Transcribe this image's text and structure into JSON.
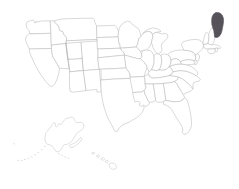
{
  "map": {
    "title": "United States Map",
    "type": "choropleth",
    "projection": "albers-usa",
    "background_color": "#ffffff",
    "default_fill": "#ffffff",
    "outline_color": "#b9b9bd",
    "highlight_color": "#55525a",
    "highlighted_regions": [
      "Maine"
    ],
    "includes_insets": [
      "Alaska",
      "Hawaii"
    ],
    "region_count": 51,
    "legend": null,
    "labels_visible": false
  },
  "regions": [
    {
      "id": "WA",
      "name": "Washington",
      "highlighted": false
    },
    {
      "id": "OR",
      "name": "Oregon",
      "highlighted": false
    },
    {
      "id": "CA",
      "name": "California",
      "highlighted": false
    },
    {
      "id": "NV",
      "name": "Nevada",
      "highlighted": false
    },
    {
      "id": "ID",
      "name": "Idaho",
      "highlighted": false
    },
    {
      "id": "MT",
      "name": "Montana",
      "highlighted": false
    },
    {
      "id": "WY",
      "name": "Wyoming",
      "highlighted": false
    },
    {
      "id": "UT",
      "name": "Utah",
      "highlighted": false
    },
    {
      "id": "AZ",
      "name": "Arizona",
      "highlighted": false
    },
    {
      "id": "CO",
      "name": "Colorado",
      "highlighted": false
    },
    {
      "id": "NM",
      "name": "New Mexico",
      "highlighted": false
    },
    {
      "id": "ND",
      "name": "North Dakota",
      "highlighted": false
    },
    {
      "id": "SD",
      "name": "South Dakota",
      "highlighted": false
    },
    {
      "id": "NE",
      "name": "Nebraska",
      "highlighted": false
    },
    {
      "id": "KS",
      "name": "Kansas",
      "highlighted": false
    },
    {
      "id": "OK",
      "name": "Oklahoma",
      "highlighted": false
    },
    {
      "id": "TX",
      "name": "Texas",
      "highlighted": false
    },
    {
      "id": "MN",
      "name": "Minnesota",
      "highlighted": false
    },
    {
      "id": "IA",
      "name": "Iowa",
      "highlighted": false
    },
    {
      "id": "MO",
      "name": "Missouri",
      "highlighted": false
    },
    {
      "id": "AR",
      "name": "Arkansas",
      "highlighted": false
    },
    {
      "id": "LA",
      "name": "Louisiana",
      "highlighted": false
    },
    {
      "id": "WI",
      "name": "Wisconsin",
      "highlighted": false
    },
    {
      "id": "IL",
      "name": "Illinois",
      "highlighted": false
    },
    {
      "id": "MI",
      "name": "Michigan",
      "highlighted": false
    },
    {
      "id": "IN",
      "name": "Indiana",
      "highlighted": false
    },
    {
      "id": "OH",
      "name": "Ohio",
      "highlighted": false
    },
    {
      "id": "KY",
      "name": "Kentucky",
      "highlighted": false
    },
    {
      "id": "TN",
      "name": "Tennessee",
      "highlighted": false
    },
    {
      "id": "MS",
      "name": "Mississippi",
      "highlighted": false
    },
    {
      "id": "AL",
      "name": "Alabama",
      "highlighted": false
    },
    {
      "id": "GA",
      "name": "Georgia",
      "highlighted": false
    },
    {
      "id": "FL",
      "name": "Florida",
      "highlighted": false
    },
    {
      "id": "SC",
      "name": "South Carolina",
      "highlighted": false
    },
    {
      "id": "NC",
      "name": "North Carolina",
      "highlighted": false
    },
    {
      "id": "VA",
      "name": "Virginia",
      "highlighted": false
    },
    {
      "id": "WV",
      "name": "West Virginia",
      "highlighted": false
    },
    {
      "id": "MD",
      "name": "Maryland",
      "highlighted": false
    },
    {
      "id": "DE",
      "name": "Delaware",
      "highlighted": false
    },
    {
      "id": "PA",
      "name": "Pennsylvania",
      "highlighted": false
    },
    {
      "id": "NJ",
      "name": "New Jersey",
      "highlighted": false
    },
    {
      "id": "NY",
      "name": "New York",
      "highlighted": false
    },
    {
      "id": "CT",
      "name": "Connecticut",
      "highlighted": false
    },
    {
      "id": "RI",
      "name": "Rhode Island",
      "highlighted": false
    },
    {
      "id": "MA",
      "name": "Massachusetts",
      "highlighted": false
    },
    {
      "id": "VT",
      "name": "Vermont",
      "highlighted": false
    },
    {
      "id": "NH",
      "name": "New Hampshire",
      "highlighted": false
    },
    {
      "id": "ME",
      "name": "Maine",
      "highlighted": true
    },
    {
      "id": "AK",
      "name": "Alaska",
      "highlighted": false
    },
    {
      "id": "HI",
      "name": "Hawaii",
      "highlighted": false
    },
    {
      "id": "DC",
      "name": "District of Columbia",
      "highlighted": false
    }
  ]
}
